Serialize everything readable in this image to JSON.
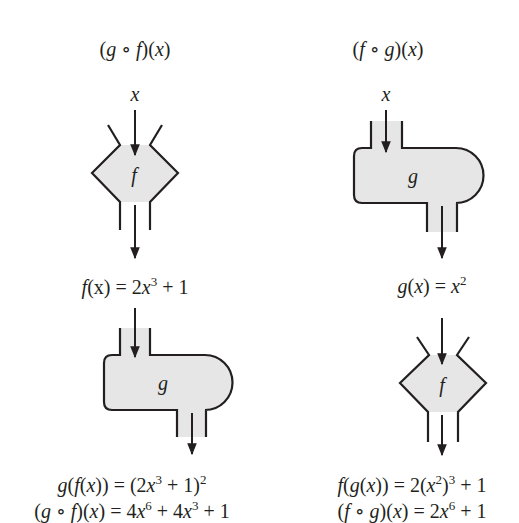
{
  "diagram": {
    "left_column": {
      "title": {
        "open": "(",
        "g": "g",
        "circ": " ∘ ",
        "f": "f",
        "close": ")(",
        "x": "x",
        "end": ")"
      },
      "input_label": "x",
      "first_machine": {
        "type": "f",
        "label": "f"
      },
      "intermediate": {
        "lhs_f": "f",
        "lhs_rest": "(x) = 2",
        "x": "x",
        "exp": "3",
        "tail": " + 1"
      },
      "second_machine": {
        "type": "g",
        "label": "g"
      },
      "result_line1": {
        "g": "g",
        "p1": "(",
        "f": "f",
        "p2": "(",
        "x": "x",
        "p3": ")) = (2",
        "x2": "x",
        "exp1": "3",
        "p4": " + 1)",
        "exp2": "2"
      },
      "result_line2": {
        "p1": "(",
        "g": "g",
        "circ": " ∘ ",
        "f": "f",
        "p2": ")(",
        "x": "x",
        "p3": ") = 4",
        "x2": "x",
        "exp1": "6",
        "p4": " + 4",
        "x3": "x",
        "exp2": "3",
        "p5": " + 1"
      }
    },
    "right_column": {
      "title": {
        "open": "(",
        "f": "f",
        "circ": " ∘ ",
        "g": "g",
        "close": ")(",
        "x": "x",
        "end": ")"
      },
      "input_label": "x",
      "first_machine": {
        "type": "g",
        "label": "g"
      },
      "intermediate": {
        "g": "g",
        "p1": "(",
        "x": "x",
        "p2": ") = ",
        "x2": "x",
        "exp": "2"
      },
      "second_machine": {
        "type": "f",
        "label": "f"
      },
      "result_line1": {
        "f": "f",
        "p1": "(",
        "g": "g",
        "p2": "(",
        "x": "x",
        "p3": ")) = 2(",
        "x2": "x",
        "exp1": "2",
        "p4": ")",
        "exp2": "3",
        "p5": " + 1"
      },
      "result_line2": {
        "p1": "(",
        "f": "f",
        "circ": " ∘ ",
        "g": "g",
        "p2": ")(",
        "x": "x",
        "p3": ") = 2",
        "x2": "x",
        "exp1": "6",
        "p4": " + 1"
      }
    },
    "colors": {
      "ink": "#231f20",
      "machine_fill": "#e6e6e6",
      "background": "#ffffff"
    }
  }
}
